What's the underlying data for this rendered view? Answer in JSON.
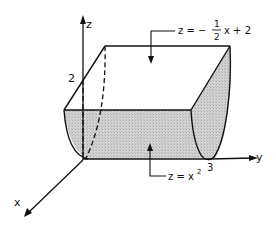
{
  "diagram": {
    "type": "3d-solid-region",
    "axes": {
      "x_label": "x",
      "y_label": "y",
      "z_label": "z"
    },
    "tick_labels": {
      "z_intercept": "2",
      "y_intercept": "3"
    },
    "annotations": {
      "top_surface": {
        "lhs": "z = −",
        "frac_num": "1",
        "frac_den": "2",
        "rhs": "x + 2"
      },
      "bottom_surface": {
        "lhs": "z = x",
        "exponent": "2"
      }
    },
    "colors": {
      "line": "#111111",
      "shade": "#c8c8c8",
      "background": "#ffffff"
    }
  }
}
